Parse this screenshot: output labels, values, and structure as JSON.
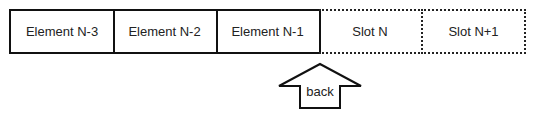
{
  "cells": [
    {
      "label": "Element N-3",
      "style": "solid"
    },
    {
      "label": "Element N-2",
      "style": "solid"
    },
    {
      "label": "Element N-1",
      "style": "solid"
    },
    {
      "label": "Slot N",
      "style": "dotted"
    },
    {
      "label": "Slot N+1",
      "style": "dotted"
    }
  ],
  "pointer": {
    "label": "back",
    "target_index": 3
  }
}
